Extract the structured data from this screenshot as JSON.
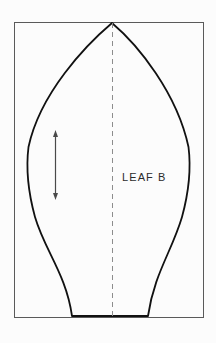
{
  "figure": {
    "background_color": "#fcfcfc",
    "width": 216,
    "height": 343
  },
  "frame": {
    "name": "border-rectangle",
    "x": 14,
    "y": 22,
    "width": 189,
    "height": 295,
    "stroke_color": "#5a5a5a",
    "stroke_width": 1
  },
  "leaf": {
    "label": "LEAF B",
    "stroke_color": "#111111",
    "stroke_width": 1.8,
    "fill": "none",
    "apex": {
      "x": 112,
      "y": 23
    },
    "base_left": {
      "x": 72,
      "y": 316
    },
    "base_right": {
      "x": 148,
      "y": 316
    },
    "widest_left_x": 27,
    "widest_right_x": 190,
    "widest_y": 165
  },
  "centerline": {
    "name": "fold-line",
    "x": 112,
    "y_top": 23,
    "y_bottom": 316,
    "stroke_color": "#8d8d8d",
    "stroke_width": 1,
    "dash": "5 4"
  },
  "grain_arrow": {
    "name": "grain-direction-arrow",
    "x": 55,
    "y_top": 130,
    "y_bottom": 200,
    "stroke_color": "#4a4a4a",
    "stroke_width": 1.2,
    "double_headed": true,
    "head_width": 5,
    "head_length": 7
  },
  "label_position": {
    "x": 122,
    "y": 181
  }
}
